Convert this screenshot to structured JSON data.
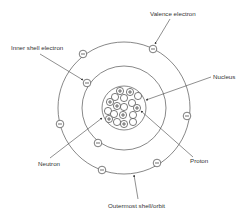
{
  "diagram": {
    "title": "",
    "labels": {
      "valence_electron": "Valence electron",
      "inner_shell_electron": "Inner shell electron",
      "nucleus": "Nucleus",
      "neutron": "Neutron",
      "proton": "Proton",
      "outermost_shell": "Outermost shell/orbit"
    },
    "nucleus": {
      "cx": 124,
      "cy": 108,
      "r": 22
    },
    "shells": [
      {
        "name": "inner-shell",
        "r": 42
      },
      {
        "name": "outer-shell",
        "r": 66
      }
    ],
    "electrons": [
      {
        "shell": "outer",
        "x": 83,
        "y": 54,
        "sign": "-"
      },
      {
        "shell": "outer",
        "x": 153,
        "y": 49,
        "sign": "-"
      },
      {
        "shell": "inner",
        "x": 87,
        "y": 83,
        "sign": "-"
      },
      {
        "shell": "outer",
        "x": 60,
        "y": 124,
        "sign": "-"
      },
      {
        "shell": "outer",
        "x": 187,
        "y": 116,
        "sign": "-"
      },
      {
        "shell": "inner",
        "x": 98,
        "y": 143,
        "sign": "-"
      },
      {
        "shell": "outer",
        "x": 102,
        "y": 170,
        "sign": "-"
      },
      {
        "shell": "outer",
        "x": 157,
        "y": 163,
        "sign": "-"
      }
    ],
    "nucleons": [
      {
        "type": "proton",
        "x": 120,
        "y": 91
      },
      {
        "type": "proton",
        "x": 130,
        "y": 92
      },
      {
        "type": "neutron",
        "x": 138,
        "y": 96
      },
      {
        "type": "neutron",
        "x": 124,
        "y": 98
      },
      {
        "type": "neutron",
        "x": 115,
        "y": 97
      },
      {
        "type": "proton",
        "x": 110,
        "y": 102
      },
      {
        "type": "proton",
        "x": 117,
        "y": 106
      },
      {
        "type": "neutron",
        "x": 124,
        "y": 107
      },
      {
        "type": "neutron",
        "x": 132,
        "y": 103
      },
      {
        "type": "proton",
        "x": 137,
        "y": 108
      },
      {
        "type": "neutron",
        "x": 108,
        "y": 111
      },
      {
        "type": "neutron",
        "x": 114,
        "y": 114
      },
      {
        "type": "proton",
        "x": 123,
        "y": 115
      },
      {
        "type": "neutron",
        "x": 133,
        "y": 115
      },
      {
        "type": "proton",
        "x": 109,
        "y": 119
      },
      {
        "type": "neutron",
        "x": 117,
        "y": 122
      },
      {
        "type": "proton",
        "x": 124,
        "y": 124
      },
      {
        "type": "neutron",
        "x": 133,
        "y": 122
      }
    ]
  }
}
